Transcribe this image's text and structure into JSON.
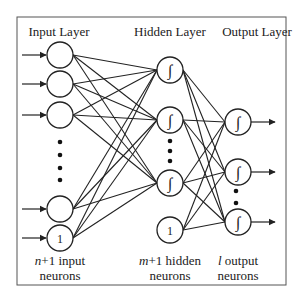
{
  "diagram": {
    "type": "neural-network",
    "layers": [
      {
        "title": "Input Layer",
        "caption_var": "n",
        "caption_rest": "+1 input",
        "caption_line2": "neurons",
        "neuron_count_shown": 4,
        "has_bias": true,
        "bias_label": "1",
        "activation_symbol": ""
      },
      {
        "title": "Hidden Layer",
        "caption_var": "m",
        "caption_rest": "+1 hidden",
        "caption_line2": "neurons",
        "neuron_count_shown": 3,
        "has_bias": true,
        "bias_label": "1",
        "activation_symbol": "∫"
      },
      {
        "title": "Output Layer",
        "caption_var": "l",
        "caption_rest": " output",
        "caption_line2": "neurons",
        "neuron_count_shown": 3,
        "has_bias": false,
        "activation_symbol": "∫"
      }
    ],
    "colors": {
      "line": "#222222",
      "frame": "#555555",
      "background": "#ffffff"
    }
  }
}
